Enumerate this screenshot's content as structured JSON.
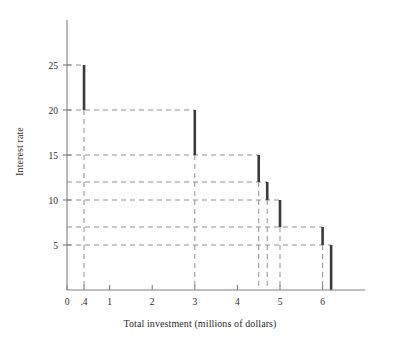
{
  "chart_data": {
    "type": "line",
    "subtype": "step",
    "title": "",
    "xlabel": "Total investment (millions of dollars)",
    "ylabel": "Interest rate",
    "xlim": [
      0,
      7.0
    ],
    "ylim": [
      0,
      28
    ],
    "grid": true,
    "grid_style": "dashed",
    "legend": "none",
    "x_ticks": [
      {
        "value": 0,
        "label": "0"
      },
      {
        "value": 0.4,
        "label": ".4"
      },
      {
        "value": 1,
        "label": "1"
      },
      {
        "value": 2,
        "label": "2"
      },
      {
        "value": 3,
        "label": "3"
      },
      {
        "value": 4,
        "label": "4"
      },
      {
        "value": 5,
        "label": "5"
      },
      {
        "value": 6,
        "label": "6"
      }
    ],
    "y_ticks": [
      {
        "value": 5,
        "label": "5"
      },
      {
        "value": 10,
        "label": "10"
      },
      {
        "value": 15,
        "label": "15"
      },
      {
        "value": 20,
        "label": "20"
      },
      {
        "value": 25,
        "label": "25"
      }
    ],
    "y_gridlines_unlabeled": [
      7,
      12
    ],
    "x_gridlines": [
      0.4,
      3,
      4.5,
      4.7,
      5,
      6,
      6.2
    ],
    "steps": [
      {
        "rate": 25,
        "x_start": 0,
        "x_end": 0.4
      },
      {
        "rate": 20,
        "x_start": 0.4,
        "x_end": 3.0
      },
      {
        "rate": 15,
        "x_start": 3.0,
        "x_end": 4.5
      },
      {
        "rate": 12,
        "x_start": 4.5,
        "x_end": 4.7
      },
      {
        "rate": 10,
        "x_start": 4.7,
        "x_end": 5.0
      },
      {
        "rate": 7,
        "x_start": 5.0,
        "x_end": 6.0
      },
      {
        "rate": 5,
        "x_start": 6.0,
        "x_end": 6.2
      }
    ],
    "drops": [
      {
        "x": 0.4,
        "from": 25,
        "to": 20
      },
      {
        "x": 3.0,
        "from": 20,
        "to": 15
      },
      {
        "x": 4.5,
        "from": 15,
        "to": 12
      },
      {
        "x": 4.7,
        "from": 12,
        "to": 10
      },
      {
        "x": 5.0,
        "from": 10,
        "to": 7
      },
      {
        "x": 6.0,
        "from": 7,
        "to": 5
      },
      {
        "x": 6.2,
        "from": 5,
        "to": 0
      }
    ]
  },
  "colors": {
    "step_line": "#3a3a3a",
    "gridline": "#8f8f8f",
    "axis": "#808080",
    "text": "#2b2b2b",
    "background": "#ffffff"
  }
}
